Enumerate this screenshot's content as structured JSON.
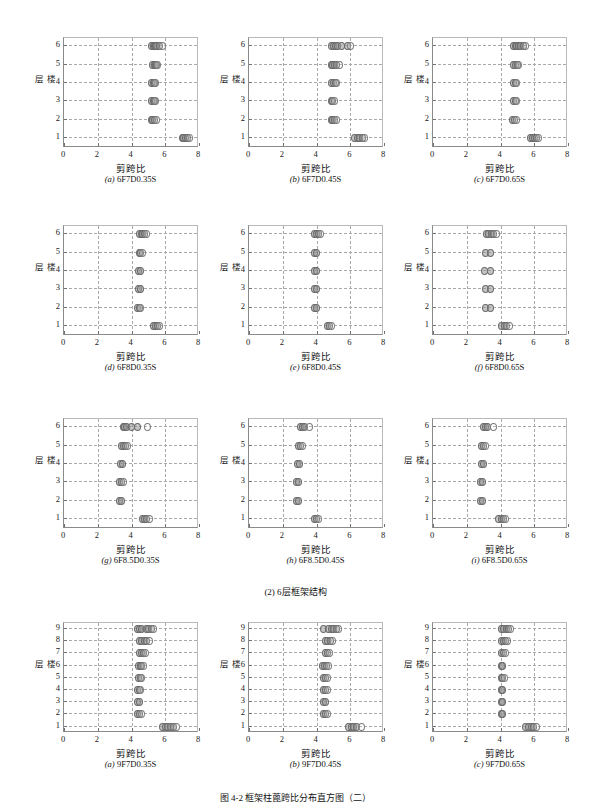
{
  "figure": {
    "section_caption": "(2) 6层框架结构",
    "bottom_caption": "图 4-2   框架柱蓖跨比分布直方图（二）",
    "axis": {
      "xlabel": "剪跨比",
      "ylabel": "楼层",
      "xticks": [
        "0",
        "2",
        "4",
        "6",
        "8"
      ],
      "xlim": [
        0,
        8
      ],
      "yticks6": [
        "1",
        "2",
        "3",
        "4",
        "5",
        "6"
      ],
      "yticks9": [
        "1",
        "2",
        "3",
        "4",
        "5",
        "6",
        "7",
        "8",
        "9"
      ]
    }
  },
  "chart_data": [
    {
      "id": "a-6F7D035S",
      "type": "scatter",
      "title": "6F7D0.35S",
      "tag_letter": "a",
      "xlabel": "剪跨比",
      "ylabel": "楼层",
      "xlim": [
        0,
        8
      ],
      "ylim": [
        0.4,
        6.4
      ],
      "grid": true,
      "series": [
        {
          "name": "floor6",
          "y": 6,
          "x": [
            5.15,
            5.22,
            5.3,
            5.38,
            5.45,
            5.6,
            5.75
          ]
        },
        {
          "name": "floor5",
          "y": 5,
          "x": [
            5.2,
            5.28,
            5.35,
            5.42,
            5.5
          ]
        },
        {
          "name": "floor4",
          "y": 4,
          "x": [
            5.15,
            5.22,
            5.3,
            5.38
          ]
        },
        {
          "name": "floor3",
          "y": 3,
          "x": [
            5.15,
            5.22,
            5.3,
            5.38
          ]
        },
        {
          "name": "floor2",
          "y": 2,
          "x": [
            5.1,
            5.2,
            5.3,
            5.4
          ]
        },
        {
          "name": "floor1",
          "y": 1,
          "x": [
            6.95,
            7.05,
            7.15,
            7.25,
            7.35
          ]
        }
      ]
    },
    {
      "id": "b-6F7D045S",
      "type": "scatter",
      "title": "6F7D0.45S",
      "tag_letter": "b",
      "xlabel": "剪跨比",
      "ylabel": "楼层",
      "xlim": [
        0,
        8
      ],
      "ylim": [
        0.4,
        6.4
      ],
      "grid": true,
      "series": [
        {
          "name": "floor6",
          "y": 6,
          "x": [
            4.85,
            4.95,
            5.05,
            5.2,
            5.45,
            5.75,
            5.95
          ]
        },
        {
          "name": "floor5",
          "y": 5,
          "x": [
            4.8,
            4.9,
            5.0,
            5.15,
            5.3
          ]
        },
        {
          "name": "floor4",
          "y": 4,
          "x": [
            4.85,
            4.95,
            5.05,
            5.15
          ]
        },
        {
          "name": "floor3",
          "y": 3,
          "x": [
            4.8,
            4.9,
            5.0
          ]
        },
        {
          "name": "floor2",
          "y": 2,
          "x": [
            4.8,
            4.9,
            5.0,
            5.15
          ]
        },
        {
          "name": "floor1",
          "y": 1,
          "x": [
            6.2,
            6.35,
            6.5,
            6.65,
            6.8
          ]
        }
      ]
    },
    {
      "id": "c-6F7D065S",
      "type": "scatter",
      "title": "6F7D0.65S",
      "tag_letter": "c",
      "xlabel": "剪跨比",
      "ylabel": "楼层",
      "xlim": [
        0,
        8
      ],
      "ylim": [
        0.4,
        6.4
      ],
      "grid": true,
      "series": [
        {
          "name": "floor6",
          "y": 6,
          "x": [
            4.7,
            4.8,
            4.9,
            5.0,
            5.15,
            5.3,
            5.45
          ]
        },
        {
          "name": "floor5",
          "y": 5,
          "x": [
            4.72,
            4.82,
            4.92,
            5.02
          ]
        },
        {
          "name": "floor4",
          "y": 4,
          "x": [
            4.7,
            4.8,
            4.9
          ]
        },
        {
          "name": "floor3",
          "y": 3,
          "x": [
            4.7,
            4.8,
            4.9
          ]
        },
        {
          "name": "floor2",
          "y": 2,
          "x": [
            4.68,
            4.78,
            4.88
          ]
        },
        {
          "name": "floor1",
          "y": 1,
          "x": [
            5.7,
            5.82,
            5.95,
            6.08,
            6.2
          ]
        }
      ]
    },
    {
      "id": "d-6F8D035S",
      "type": "scatter",
      "title": "6F8D0.35S",
      "tag_letter": "d",
      "xlabel": "剪跨比",
      "ylabel": "楼层",
      "xlim": [
        0,
        8
      ],
      "ylim": [
        0.4,
        6.4
      ],
      "grid": true,
      "series": [
        {
          "name": "floor6",
          "y": 6,
          "x": [
            4.42,
            4.52,
            4.62,
            4.72,
            4.85
          ]
        },
        {
          "name": "floor5",
          "y": 5,
          "x": [
            4.4,
            4.5,
            4.62
          ]
        },
        {
          "name": "floor4",
          "y": 4,
          "x": [
            4.38,
            4.48
          ]
        },
        {
          "name": "floor3",
          "y": 3,
          "x": [
            4.38,
            4.48
          ]
        },
        {
          "name": "floor2",
          "y": 2,
          "x": [
            4.3,
            4.4,
            4.5
          ]
        },
        {
          "name": "floor1",
          "y": 1,
          "x": [
            5.25,
            5.38,
            5.5,
            5.62
          ]
        }
      ]
    },
    {
      "id": "e-6F8D045S",
      "type": "scatter",
      "title": "6F8D0.45S",
      "tag_letter": "e",
      "xlabel": "剪跨比",
      "ylabel": "楼层",
      "xlim": [
        0,
        8
      ],
      "ylim": [
        0.4,
        6.4
      ],
      "grid": true,
      "series": [
        {
          "name": "floor6",
          "y": 6,
          "x": [
            3.85,
            3.95,
            4.05,
            4.15
          ]
        },
        {
          "name": "floor5",
          "y": 5,
          "x": [
            3.85,
            3.95
          ]
        },
        {
          "name": "floor4",
          "y": 4,
          "x": [
            3.85,
            3.93
          ]
        },
        {
          "name": "floor3",
          "y": 3,
          "x": [
            3.85,
            3.95
          ]
        },
        {
          "name": "floor2",
          "y": 2,
          "x": [
            3.85,
            3.93
          ]
        },
        {
          "name": "floor1",
          "y": 1,
          "x": [
            4.6,
            4.72,
            4.85
          ]
        }
      ]
    },
    {
      "id": "f-6F8D065S",
      "type": "scatter",
      "title": "6F8D0.65S",
      "tag_letter": "f",
      "xlabel": "剪跨比",
      "ylabel": "楼层",
      "xlim": [
        0,
        8
      ],
      "ylim": [
        0.4,
        6.4
      ],
      "grid": true,
      "series": [
        {
          "name": "floor6",
          "y": 6,
          "x": [
            3.1,
            3.25,
            3.4,
            3.55,
            3.7
          ]
        },
        {
          "name": "floor5",
          "y": 5,
          "x": [
            3.05,
            3.35
          ]
        },
        {
          "name": "floor4",
          "y": 4,
          "x": [
            3.0,
            3.32
          ]
        },
        {
          "name": "floor3",
          "y": 3,
          "x": [
            3.05,
            3.32
          ]
        },
        {
          "name": "floor2",
          "y": 2,
          "x": [
            3.05,
            3.32
          ]
        },
        {
          "name": "floor1",
          "y": 1,
          "x": [
            4.0,
            4.15,
            4.3,
            4.45
          ]
        }
      ]
    },
    {
      "id": "g-6F85D035S",
      "type": "scatter",
      "title": "6F8.5D0.35S",
      "tag_letter": "g",
      "xlabel": "剪跨比",
      "ylabel": "楼层",
      "xlim": [
        0,
        8
      ],
      "ylim": [
        0.4,
        6.4
      ],
      "grid": true,
      "series": [
        {
          "name": "floor6",
          "y": 6,
          "x": [
            3.45,
            3.55,
            3.65,
            3.95,
            4.3,
            4.9
          ]
        },
        {
          "name": "floor5",
          "y": 5,
          "x": [
            3.35,
            3.45,
            3.58,
            3.7
          ]
        },
        {
          "name": "floor4",
          "y": 4,
          "x": [
            3.3,
            3.42
          ]
        },
        {
          "name": "floor3",
          "y": 3,
          "x": [
            3.25,
            3.35,
            3.45
          ]
        },
        {
          "name": "floor2",
          "y": 2,
          "x": [
            3.25,
            3.35
          ]
        },
        {
          "name": "floor1",
          "y": 1,
          "x": [
            4.6,
            4.72,
            4.85,
            4.98
          ]
        }
      ]
    },
    {
      "id": "h-6F85D045S",
      "type": "scatter",
      "title": "6F8.5D0.45S",
      "tag_letter": "h",
      "xlabel": "剪跨比",
      "ylabel": "楼层",
      "xlim": [
        0,
        8
      ],
      "ylim": [
        0.4,
        6.4
      ],
      "grid": true,
      "series": [
        {
          "name": "floor6",
          "y": 6,
          "x": [
            3.0,
            3.1,
            3.2,
            3.5
          ]
        },
        {
          "name": "floor5",
          "y": 5,
          "x": [
            2.85,
            2.98,
            3.1
          ]
        },
        {
          "name": "floor4",
          "y": 4,
          "x": [
            2.82,
            2.95
          ]
        },
        {
          "name": "floor3",
          "y": 3,
          "x": [
            2.78,
            2.88
          ]
        },
        {
          "name": "floor2",
          "y": 2,
          "x": [
            2.75,
            2.85
          ]
        },
        {
          "name": "floor1",
          "y": 1,
          "x": [
            3.8,
            3.92,
            4.05
          ]
        }
      ]
    },
    {
      "id": "i-6F85D065S",
      "type": "scatter",
      "title": "6F8.5D0.65S",
      "tag_letter": "i",
      "xlabel": "剪跨比",
      "ylabel": "楼层",
      "xlim": [
        0,
        8
      ],
      "ylim": [
        0.4,
        6.4
      ],
      "grid": true,
      "series": [
        {
          "name": "floor6",
          "y": 6,
          "x": [
            2.95,
            3.05,
            3.15,
            3.5
          ]
        },
        {
          "name": "floor5",
          "y": 5,
          "x": [
            2.82,
            2.95,
            3.05
          ]
        },
        {
          "name": "floor4",
          "y": 4,
          "x": [
            2.82,
            2.95
          ]
        },
        {
          "name": "floor3",
          "y": 3,
          "x": [
            2.78,
            2.88
          ]
        },
        {
          "name": "floor2",
          "y": 2,
          "x": [
            2.75,
            2.85
          ]
        },
        {
          "name": "floor1",
          "y": 1,
          "x": [
            3.85,
            3.98,
            4.1,
            4.22
          ]
        }
      ]
    },
    {
      "id": "a9-9F7D035S",
      "type": "scatter",
      "title": "9F7D0.35S",
      "tag_letter": "a",
      "xlabel": "剪跨比",
      "ylabel": "楼层",
      "xlim": [
        0,
        8
      ],
      "ylim": [
        0.4,
        9.4
      ],
      "grid": true,
      "series": [
        {
          "name": "floor9",
          "y": 9,
          "x": [
            4.3,
            4.42,
            4.55,
            4.8,
            4.95,
            5.1,
            5.25
          ]
        },
        {
          "name": "floor8",
          "y": 8,
          "x": [
            4.4,
            4.55,
            4.7,
            4.85,
            5.0
          ]
        },
        {
          "name": "floor7",
          "y": 7,
          "x": [
            4.4,
            4.52,
            4.65,
            4.78
          ]
        },
        {
          "name": "floor6",
          "y": 6,
          "x": [
            4.35,
            4.45,
            4.55,
            4.65
          ]
        },
        {
          "name": "floor5",
          "y": 5,
          "x": [
            4.35,
            4.45,
            4.55
          ]
        },
        {
          "name": "floor4",
          "y": 4,
          "x": [
            4.3,
            4.4,
            4.5
          ]
        },
        {
          "name": "floor3",
          "y": 3,
          "x": [
            4.3,
            4.4
          ]
        },
        {
          "name": "floor2",
          "y": 2,
          "x": [
            4.3,
            4.42,
            4.55
          ]
        },
        {
          "name": "floor1",
          "y": 1,
          "x": [
            5.8,
            5.95,
            6.1,
            6.25,
            6.45,
            6.6
          ]
        }
      ]
    },
    {
      "id": "b9-9F7D045S",
      "type": "scatter",
      "title": "9F7D0.45S",
      "tag_letter": "b",
      "xlabel": "剪跨比",
      "ylabel": "楼层",
      "xlim": [
        0,
        8
      ],
      "ylim": [
        0.4,
        9.4
      ],
      "grid": true,
      "series": [
        {
          "name": "floor9",
          "y": 9,
          "x": [
            4.35,
            4.65,
            4.8,
            4.95,
            5.1,
            5.25
          ]
        },
        {
          "name": "floor8",
          "y": 8,
          "x": [
            4.5,
            4.62,
            4.75,
            4.9
          ]
        },
        {
          "name": "floor7",
          "y": 7,
          "x": [
            4.45,
            4.58,
            4.7
          ]
        },
        {
          "name": "floor6",
          "y": 6,
          "x": [
            4.3,
            4.42,
            4.55,
            4.68
          ]
        },
        {
          "name": "floor5",
          "y": 5,
          "x": [
            4.35,
            4.48,
            4.6
          ]
        },
        {
          "name": "floor4",
          "y": 4,
          "x": [
            4.35,
            4.48,
            4.6
          ]
        },
        {
          "name": "floor3",
          "y": 3,
          "x": [
            4.35,
            4.48
          ]
        },
        {
          "name": "floor2",
          "y": 2,
          "x": [
            4.35,
            4.5,
            4.62
          ]
        },
        {
          "name": "floor1",
          "y": 1,
          "x": [
            5.85,
            6.0,
            6.15,
            6.3,
            6.6
          ]
        }
      ]
    },
    {
      "id": "c9-9F7D065S",
      "type": "scatter",
      "title": "9F7D0.65S",
      "tag_letter": "c",
      "xlabel": "剪跨比",
      "ylabel": "楼层",
      "xlim": [
        0,
        8
      ],
      "ylim": [
        0.4,
        9.4
      ],
      "grid": true,
      "series": [
        {
          "name": "floor9",
          "y": 9,
          "x": [
            4.0,
            4.12,
            4.28,
            4.42,
            4.55
          ]
        },
        {
          "name": "floor8",
          "y": 8,
          "x": [
            4.0,
            4.12,
            4.25,
            4.38
          ]
        },
        {
          "name": "floor7",
          "y": 7,
          "x": [
            4.0,
            4.12,
            4.25
          ]
        },
        {
          "name": "floor6",
          "y": 6,
          "x": [
            3.98,
            4.08
          ]
        },
        {
          "name": "floor5",
          "y": 5,
          "x": [
            3.98,
            4.08,
            4.18
          ]
        },
        {
          "name": "floor4",
          "y": 4,
          "x": [
            3.98,
            4.08
          ]
        },
        {
          "name": "floor3",
          "y": 3,
          "x": [
            3.98,
            4.08
          ]
        },
        {
          "name": "floor2",
          "y": 2,
          "x": [
            3.98,
            4.08
          ]
        },
        {
          "name": "floor1",
          "y": 1,
          "x": [
            5.45,
            5.6,
            5.75,
            5.9,
            6.05
          ]
        }
      ]
    }
  ]
}
